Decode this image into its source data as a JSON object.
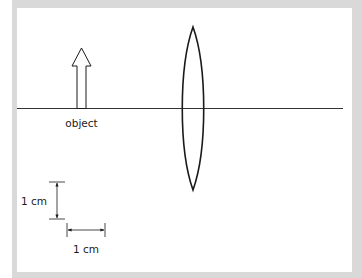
{
  "diagram": {
    "labels": {
      "object": "object",
      "scale_vertical": "1 cm",
      "scale_horizontal": "1 cm"
    },
    "colors": {
      "border": "#d9d9d9",
      "background": "#ffffff",
      "stroke": "#1a1a1a"
    },
    "principal_axis": {
      "x1": 17,
      "x2": 343,
      "y": 108.5
    },
    "object_arrow": {
      "tip_x": 81.5,
      "tip_y": 48,
      "head_base_y": 66,
      "head_left": 72,
      "head_right": 91,
      "shaft_left": 77,
      "shaft_right": 86,
      "base_y": 108.5
    },
    "lens": {
      "center_x": 193,
      "top_y": 27,
      "bottom_y": 190,
      "half_width_at_axis": 13
    },
    "scale_bar_vertical": {
      "x": 57,
      "y1": 182,
      "y2": 219,
      "tick_half": 8
    },
    "scale_bar_horizontal": {
      "y": 230,
      "x1": 67,
      "x2": 105,
      "tick_half": 7
    }
  }
}
